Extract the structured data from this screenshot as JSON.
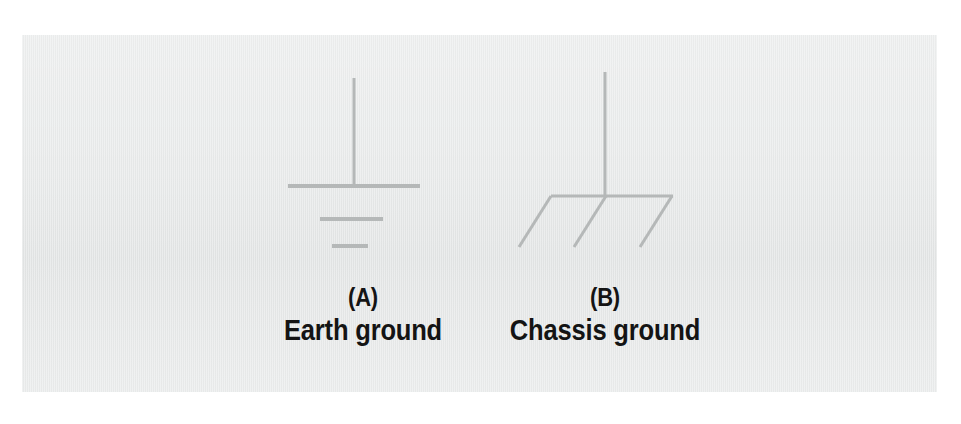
{
  "figure": {
    "background_color": "#ffffff",
    "panel_color": "#e8eaea",
    "stroke_color": "#b5b8b8",
    "label_color": "#141414",
    "symbols": [
      {
        "id": "earth-ground",
        "index": "(A)",
        "name": "Earth ground",
        "description": "Vertical lead terminating in three stacked horizontal bars of decreasing width",
        "geometry": {
          "stem": {
            "x": 354,
            "y1": 78,
            "y2": 186
          },
          "bars": [
            {
              "x1": 288,
              "x2": 420,
              "y": 186
            },
            {
              "x1": 320,
              "x2": 383,
              "y": 219
            },
            {
              "x1": 332,
              "x2": 368,
              "y": 246
            }
          ]
        }
      },
      {
        "id": "chassis-ground",
        "index": "(B)",
        "name": "Chassis ground",
        "description": "Vertical lead terminating in a horizontal bar with three parallel hatch lines slanting down to the left",
        "geometry": {
          "stem": {
            "x": 605,
            "y1": 72,
            "y2": 196
          },
          "bar": {
            "x1": 551,
            "x2": 673,
            "y": 196
          },
          "hatches": [
            {
              "x1": 551,
              "y1": 196,
              "x2": 519,
              "y2": 247
            },
            {
              "x1": 606,
              "y1": 196,
              "x2": 574,
              "y2": 247
            },
            {
              "x1": 672,
              "y1": 196,
              "x2": 640,
              "y2": 247
            }
          ]
        }
      }
    ]
  }
}
